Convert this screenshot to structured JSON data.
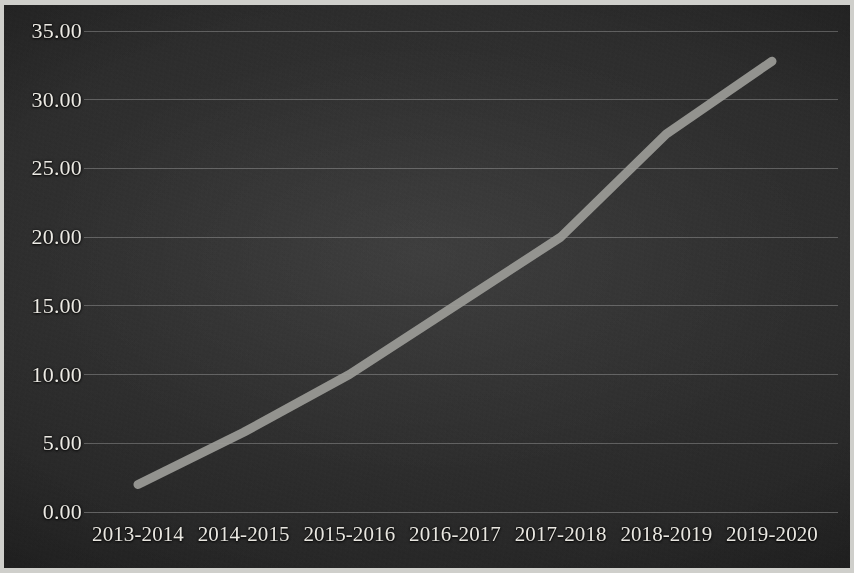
{
  "chart_data": {
    "type": "line",
    "title": "",
    "subtitle": "",
    "xlabel": "",
    "ylabel": "",
    "categories": [
      "2013-2014",
      "2014-2015",
      "2015-2016",
      "2016-2017",
      "2017-2018",
      "2018-2019",
      "2019-2020"
    ],
    "series": [
      {
        "name": "",
        "values": [
          2.0,
          5.8,
          10.0,
          15.0,
          20.0,
          27.5,
          32.8
        ]
      }
    ],
    "ylim": [
      0.0,
      35.0
    ],
    "ytick_values": [
      0.0,
      5.0,
      10.0,
      15.0,
      20.0,
      25.0,
      30.0,
      35.0
    ],
    "ytick_labels": [
      "0.00",
      "5.00",
      "10.00",
      "15.00",
      "20.00",
      "25.00",
      "30.00",
      "35.00"
    ],
    "grid": true,
    "legend": "none",
    "line_color": "#9b9b97",
    "grid_color": "#d7d7d7",
    "background_color": "#2b2b2b",
    "text_color": "#eceae4"
  }
}
